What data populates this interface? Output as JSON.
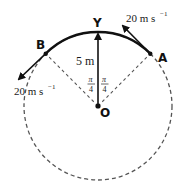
{
  "diagram": {
    "type": "circular-motion",
    "center": {
      "label": "O",
      "x": 98,
      "y": 106
    },
    "radius_px": 74,
    "points": {
      "top": {
        "label": "Y"
      },
      "right": {
        "label": "A"
      },
      "left": {
        "label": "B"
      }
    },
    "radius_label": "5 m",
    "angle_left": {
      "numerator": "π",
      "denominator": "4"
    },
    "angle_right": {
      "numerator": "π",
      "denominator": "4"
    },
    "velocity_A": {
      "value": "20 m s",
      "exponent": "−1"
    },
    "velocity_B": {
      "value": "20 m s",
      "exponent": "−1"
    },
    "colors": {
      "line": "#111111",
      "dashed": "#555555",
      "text": "#1a1a1a"
    }
  }
}
